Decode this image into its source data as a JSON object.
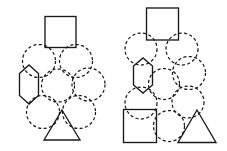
{
  "figure": {
    "width": 227,
    "height": 151,
    "background_color": "#ffffff",
    "stroke_color": "#1a1a1a",
    "panel_count": 2,
    "line_styles": {
      "solid": "solid",
      "dashed": "dashed"
    }
  },
  "panels": [
    {
      "id": "left-panel",
      "name": "clustered-packing-panel",
      "layout": "hexagonal-close-packed-cluster",
      "shape_count": 9,
      "shapes": [
        {
          "id": "l-square-top",
          "type": "square",
          "style": "solid",
          "cx": 60.5,
          "cy": 32.0,
          "size": 31
        },
        {
          "id": "l-circle-r2-left",
          "type": "circle",
          "style": "dashed",
          "cx": 39.0,
          "cy": 61.0,
          "r": 16.5
        },
        {
          "id": "l-circle-r2-right",
          "type": "circle",
          "style": "dashed",
          "cx": 76.0,
          "cy": 61.0,
          "r": 16.5
        },
        {
          "id": "l-hexagon-r3-left",
          "type": "hexagon",
          "style": "solid",
          "cx": 29.0,
          "cy": 84.5,
          "r": 19.5
        },
        {
          "id": "l-circle-r3-mid",
          "type": "circle",
          "style": "dashed",
          "cx": 58.0,
          "cy": 85.5,
          "r": 16.5
        },
        {
          "id": "l-circle-r3-right",
          "type": "circle",
          "style": "dashed",
          "cx": 88.5,
          "cy": 84.5,
          "r": 16.5
        },
        {
          "id": "l-circle-r4-left",
          "type": "circle",
          "style": "dashed",
          "cx": 43.0,
          "cy": 112.0,
          "r": 16.5
        },
        {
          "id": "l-circle-r4-right",
          "type": "circle",
          "style": "dashed",
          "cx": 79.0,
          "cy": 112.0,
          "r": 16.5
        },
        {
          "id": "l-triangle-bottom",
          "type": "triangle",
          "style": "solid",
          "cx": 62.0,
          "cy": 126.0,
          "w": 36,
          "h": 31
        }
      ]
    },
    {
      "id": "right-panel",
      "name": "grid-arrangement-panel",
      "layout": "three-column-grid",
      "shape_count": 11,
      "shapes": [
        {
          "id": "r-square-top",
          "type": "square",
          "style": "solid",
          "cx": 162.5,
          "cy": 24.0,
          "size": 32
        },
        {
          "id": "r-circle-r2-left",
          "type": "circle",
          "style": "dashed",
          "cx": 141.0,
          "cy": 49.0,
          "r": 16.0
        },
        {
          "id": "r-circle-r2-right",
          "type": "circle",
          "style": "dashed",
          "cx": 182.0,
          "cy": 49.0,
          "r": 16.0
        },
        {
          "id": "r-hexagon-r3-left",
          "type": "hexagon",
          "style": "solid",
          "cx": 143.0,
          "cy": 75.0,
          "r": 19.0
        },
        {
          "id": "r-circle-r3-mid",
          "type": "circle",
          "style": "dashed",
          "cx": 164.0,
          "cy": 84.0,
          "r": 15.5
        },
        {
          "id": "r-circle-r3-right",
          "type": "circle",
          "style": "dashed",
          "cx": 189.0,
          "cy": 73.0,
          "r": 16.5
        },
        {
          "id": "r-circle-r4-left",
          "type": "circle",
          "style": "dashed",
          "cx": 141.0,
          "cy": 103.0,
          "r": 16.0
        },
        {
          "id": "r-circle-r4-right",
          "type": "circle",
          "style": "dashed",
          "cx": 188.0,
          "cy": 102.0,
          "r": 16.0
        },
        {
          "id": "r-square-bottom",
          "type": "square",
          "style": "solid",
          "cx": 140.0,
          "cy": 126.0,
          "size": 33
        },
        {
          "id": "r-circle-r5-mid",
          "type": "circle",
          "style": "dashed",
          "cx": 169.0,
          "cy": 126.0,
          "r": 15.5
        },
        {
          "id": "r-triangle-bottom",
          "type": "triangle",
          "style": "solid",
          "cx": 197.0,
          "cy": 126.0,
          "w": 38,
          "h": 33
        }
      ]
    }
  ]
}
